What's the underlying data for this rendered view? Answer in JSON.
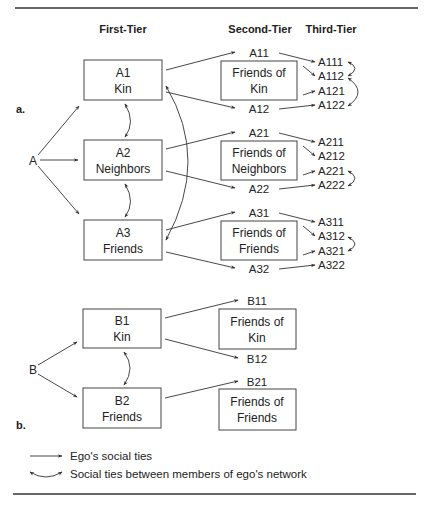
{
  "headers": {
    "first_tier": "First-Tier",
    "second_tier": "Second-Tier",
    "third_tier": "Third-Tier"
  },
  "panel_a": {
    "label": "a.",
    "ego": "A",
    "first_tier": [
      {
        "id": "A1",
        "type": "Kin"
      },
      {
        "id": "A2",
        "type": "Neighbors"
      },
      {
        "id": "A3",
        "type": "Friends"
      }
    ],
    "second_tier_boxes": [
      {
        "line1": "Friends of",
        "line2": "Kin"
      },
      {
        "line1": "Friends of",
        "line2": "Neighbors"
      },
      {
        "line1": "Friends of",
        "line2": "Friends"
      }
    ],
    "second_tier_nodes": [
      "A11",
      "A12",
      "A21",
      "A22",
      "A31",
      "A32"
    ],
    "third_tier_nodes": [
      "A111",
      "A112",
      "A121",
      "A122",
      "A211",
      "A212",
      "A221",
      "A222",
      "A311",
      "A312",
      "A321",
      "A322"
    ]
  },
  "panel_b": {
    "label": "b.",
    "ego": "B",
    "first_tier": [
      {
        "id": "B1",
        "type": "Kin"
      },
      {
        "id": "B2",
        "type": "Friends"
      }
    ],
    "second_tier_boxes": [
      {
        "line1": "Friends of",
        "line2": "Kin"
      },
      {
        "line1": "Friends of",
        "line2": "Friends"
      }
    ],
    "second_tier_nodes": [
      "B11",
      "B12",
      "B21"
    ]
  },
  "legend": {
    "ego_ties": "Ego's social ties",
    "network_ties": "Social ties between members of ego's network"
  }
}
